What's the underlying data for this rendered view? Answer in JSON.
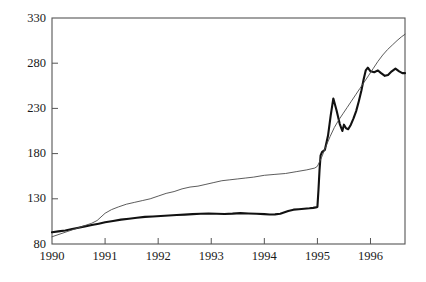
{
  "chart_data": {
    "type": "line",
    "title": "",
    "subtitle": "",
    "xlabel": "",
    "ylabel": "",
    "xlim": [
      1990,
      1996.65
    ],
    "ylim": [
      80,
      330
    ],
    "grid": false,
    "legend": "none",
    "x_ticks": [
      1990,
      1991,
      1992,
      1993,
      1994,
      1995,
      1996
    ],
    "x_tick_labels": [
      "1990",
      "1991",
      "1992",
      "1993",
      "1994",
      "1995",
      "1996"
    ],
    "y_ticks": [
      80,
      130,
      180,
      230,
      280,
      330
    ],
    "y_tick_labels": [
      "80",
      "130",
      "180",
      "230",
      "280",
      "330"
    ],
    "series": [
      {
        "name": "thick-line",
        "style": "solid",
        "width": 2.1,
        "color": "#111111",
        "points": [
          [
            1990.0,
            93
          ],
          [
            1990.12,
            94
          ],
          [
            1990.25,
            95
          ],
          [
            1990.38,
            96.5
          ],
          [
            1990.5,
            98
          ],
          [
            1990.62,
            99.5
          ],
          [
            1990.75,
            101
          ],
          [
            1990.88,
            102.5
          ],
          [
            1991.0,
            104
          ],
          [
            1991.15,
            105.5
          ],
          [
            1991.3,
            107
          ],
          [
            1991.45,
            108
          ],
          [
            1991.6,
            109
          ],
          [
            1991.75,
            110
          ],
          [
            1991.9,
            110.5
          ],
          [
            1992.05,
            111
          ],
          [
            1992.2,
            111.5
          ],
          [
            1992.35,
            112
          ],
          [
            1992.5,
            112.5
          ],
          [
            1992.65,
            113
          ],
          [
            1992.8,
            113.5
          ],
          [
            1992.95,
            113.8
          ],
          [
            1993.1,
            113.5
          ],
          [
            1993.25,
            113.2
          ],
          [
            1993.4,
            113.6
          ],
          [
            1993.55,
            114.2
          ],
          [
            1993.7,
            113.8
          ],
          [
            1993.85,
            113.4
          ],
          [
            1994.0,
            113.0
          ],
          [
            1994.1,
            112.6
          ],
          [
            1994.2,
            112.8
          ],
          [
            1994.3,
            113.4
          ],
          [
            1994.45,
            116.5
          ],
          [
            1994.55,
            118
          ],
          [
            1994.65,
            118.5
          ],
          [
            1994.75,
            119
          ],
          [
            1994.85,
            119.5
          ],
          [
            1994.92,
            120
          ],
          [
            1994.97,
            120.5
          ],
          [
            1995.0,
            121
          ],
          [
            1995.02,
            140
          ],
          [
            1995.04,
            162
          ],
          [
            1995.06,
            178
          ],
          [
            1995.09,
            182
          ],
          [
            1995.14,
            184
          ],
          [
            1995.2,
            200
          ],
          [
            1995.25,
            222
          ],
          [
            1995.3,
            241
          ],
          [
            1995.36,
            228
          ],
          [
            1995.42,
            213
          ],
          [
            1995.47,
            205
          ],
          [
            1995.5,
            212
          ],
          [
            1995.54,
            208
          ],
          [
            1995.58,
            207
          ],
          [
            1995.63,
            212
          ],
          [
            1995.68,
            219
          ],
          [
            1995.73,
            227
          ],
          [
            1995.78,
            238
          ],
          [
            1995.83,
            250
          ],
          [
            1995.87,
            262
          ],
          [
            1995.91,
            272
          ],
          [
            1995.95,
            275
          ],
          [
            1996.0,
            271
          ],
          [
            1996.07,
            270
          ],
          [
            1996.14,
            272
          ],
          [
            1996.2,
            269
          ],
          [
            1996.27,
            266
          ],
          [
            1996.33,
            267
          ],
          [
            1996.4,
            271
          ],
          [
            1996.47,
            274
          ],
          [
            1996.54,
            271
          ],
          [
            1996.6,
            269
          ],
          [
            1996.65,
            269
          ]
        ]
      },
      {
        "name": "thin-line",
        "style": "solid",
        "width": 0.9,
        "color": "#4a4a4a",
        "points": [
          [
            1990.0,
            88
          ],
          [
            1990.15,
            91
          ],
          [
            1990.3,
            94
          ],
          [
            1990.45,
            97
          ],
          [
            1990.6,
            100
          ],
          [
            1990.75,
            103
          ],
          [
            1990.85,
            106
          ],
          [
            1991.0,
            114
          ],
          [
            1991.12,
            118
          ],
          [
            1991.25,
            121
          ],
          [
            1991.4,
            124
          ],
          [
            1991.55,
            126
          ],
          [
            1991.7,
            128
          ],
          [
            1991.85,
            130
          ],
          [
            1992.0,
            133
          ],
          [
            1992.15,
            136
          ],
          [
            1992.3,
            138
          ],
          [
            1992.45,
            141
          ],
          [
            1992.6,
            143
          ],
          [
            1992.75,
            144
          ],
          [
            1992.9,
            146
          ],
          [
            1993.05,
            148
          ],
          [
            1993.2,
            150
          ],
          [
            1993.35,
            151
          ],
          [
            1993.5,
            152
          ],
          [
            1993.65,
            153
          ],
          [
            1993.8,
            154
          ],
          [
            1994.0,
            156
          ],
          [
            1994.2,
            157
          ],
          [
            1994.4,
            158
          ],
          [
            1994.6,
            160
          ],
          [
            1994.8,
            162
          ],
          [
            1994.95,
            164
          ],
          [
            1995.0,
            166
          ],
          [
            1995.08,
            176
          ],
          [
            1995.16,
            188
          ],
          [
            1995.24,
            199
          ],
          [
            1995.32,
            209
          ],
          [
            1995.4,
            217
          ],
          [
            1995.48,
            224
          ],
          [
            1995.56,
            231
          ],
          [
            1995.64,
            238
          ],
          [
            1995.72,
            245
          ],
          [
            1995.8,
            252
          ],
          [
            1995.88,
            259
          ],
          [
            1995.96,
            266
          ],
          [
            1996.05,
            274
          ],
          [
            1996.14,
            282
          ],
          [
            1996.23,
            289
          ],
          [
            1996.32,
            295
          ],
          [
            1996.41,
            300
          ],
          [
            1996.5,
            305
          ],
          [
            1996.58,
            309
          ],
          [
            1996.65,
            312
          ]
        ]
      }
    ]
  },
  "axes": {
    "frame_color": "#555555",
    "tick_color": "#555555"
  }
}
